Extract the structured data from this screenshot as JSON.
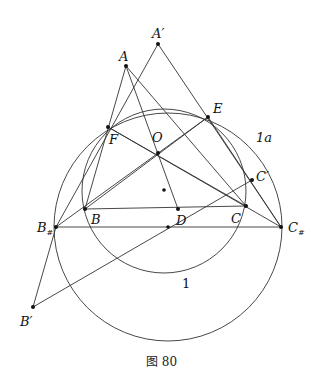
{
  "caption": "图 80",
  "points": {
    "A": "A",
    "A_prime": "A′",
    "F": "F",
    "E": "E",
    "O": "O",
    "B": "B",
    "C": "C",
    "D": "D",
    "B_sharp": "B",
    "C_sharp": "C",
    "sharp": "#",
    "B_prime": "B′",
    "C_prime": "C′"
  },
  "circle_labels": {
    "inner": "1",
    "outer": "1a"
  }
}
